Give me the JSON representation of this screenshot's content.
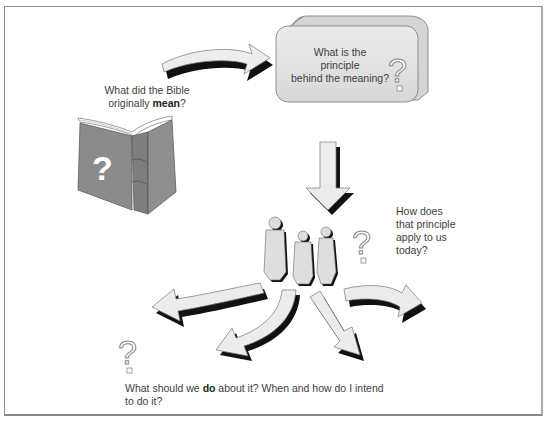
{
  "diagram": {
    "steps": [
      {
        "id": "meaning",
        "text_before": "What did the Bible originally ",
        "text_bold": "mean",
        "text_after": "?",
        "line1": "What did the Bible",
        "line2_prefix": "originally ",
        "line2_bold": "mean",
        "line2_suffix": "?",
        "icon": "book-with-question-mark-icon"
      },
      {
        "id": "principle",
        "line1": "What is the",
        "line2": "principle",
        "line3": "behind the meaning?",
        "icon": "question-mark-outline-icon",
        "container": "rounded-3d-box"
      },
      {
        "id": "application",
        "line1": "How does",
        "line2": "that principle",
        "line3": "apply to us",
        "line4": "today?",
        "icon": "people-group-icon"
      },
      {
        "id": "action",
        "line1_prefix": "What should we ",
        "line1_bold": "do",
        "line1_suffix": " about it? When and how do I intend",
        "line2": "to do it?",
        "icon": "question-mark-outline-icon"
      }
    ],
    "arrows": [
      {
        "from": "meaning",
        "to": "principle",
        "shape": "curved-right"
      },
      {
        "from": "principle",
        "to": "application",
        "shape": "down"
      },
      {
        "from": "application",
        "to": "action",
        "shape": "fan-out",
        "count": 4
      }
    ],
    "colors": {
      "book": "#8a8a8a",
      "box_fill": "#e6e6e6",
      "arrow_fill": "#ececec",
      "arrow_shadow": "#1a1a1a",
      "people_fill": "#dcdcdc",
      "border": "#8e8e8e"
    }
  }
}
